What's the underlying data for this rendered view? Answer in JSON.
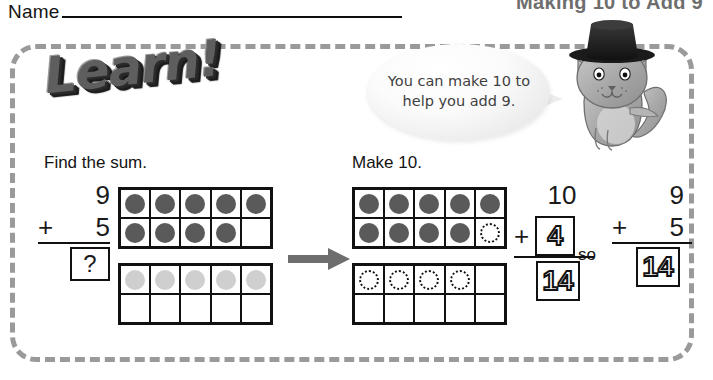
{
  "header": {
    "name_label": "Name",
    "lesson_title": "Making 10 to Add 9"
  },
  "logo": {
    "text": "Learn!"
  },
  "speech_bubble": {
    "text": "You can make 10 to help you add 9."
  },
  "mascot": {
    "name": "cat-with-top-hat"
  },
  "left_panel": {
    "caption": "Find the sum.",
    "addend_top": "9",
    "plus_sign": "+",
    "addend_bottom": "5",
    "answer": "?",
    "tenframe_top": {
      "label": "nine dark counters",
      "dots": [
        "dark",
        "dark",
        "dark",
        "dark",
        "dark",
        "dark",
        "dark",
        "dark",
        "dark",
        "empty"
      ]
    },
    "tenframe_bottom": {
      "label": "five light counters",
      "dots": [
        "light",
        "light",
        "light",
        "light",
        "light",
        "empty",
        "empty",
        "empty",
        "empty",
        "empty"
      ]
    }
  },
  "arrow": {
    "name": "right-arrow",
    "color": "#6e6e6e"
  },
  "right_panel": {
    "caption": "Make 10.",
    "tenframe_top": {
      "label": "nine dark counters plus one traced counter",
      "dots": [
        "dark",
        "dark",
        "dark",
        "dark",
        "dark",
        "dark",
        "dark",
        "dark",
        "dark",
        "dashed"
      ]
    },
    "tenframe_bottom": {
      "label": "four traced counters",
      "dots": [
        "dashed",
        "dashed",
        "dashed",
        "dashed",
        "empty",
        "empty",
        "empty",
        "empty",
        "empty",
        "empty"
      ]
    }
  },
  "equation_made_ten": {
    "addend_top": "10",
    "plus_sign": "+",
    "addend_bottom": "4",
    "sum": "14"
  },
  "connector": {
    "label": "so"
  },
  "equation_original": {
    "addend_top": "9",
    "plus_sign": "+",
    "addend_bottom": "5",
    "sum": "14"
  },
  "colors": {
    "dot_dark": "#5a5a5a",
    "dot_light": "#cfcfcf",
    "frame_border": "#9a9a9a",
    "title_gray": "#6e6e6e"
  }
}
